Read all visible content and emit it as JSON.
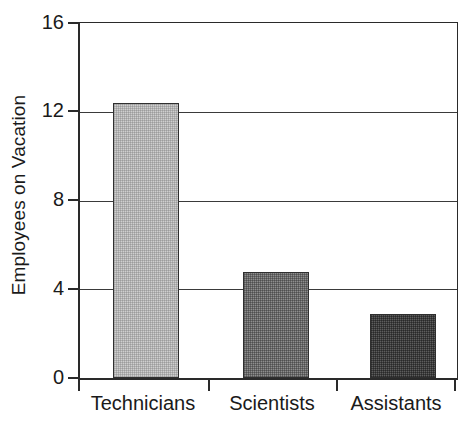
{
  "chart_data": {
    "type": "bar",
    "title": "",
    "xlabel": "",
    "ylabel": "Employees on Vacation",
    "categories": [
      "Technicians",
      "Scientists",
      "Assistants"
    ],
    "values": [
      12.4,
      4.8,
      2.9
    ],
    "ylim": [
      0,
      16
    ],
    "yticks": [
      0,
      4,
      8,
      12,
      16
    ],
    "ytick_labels": [
      "0",
      "4",
      "8",
      "12",
      "16"
    ],
    "grid": true,
    "legend": "none",
    "series": [
      {
        "name": "Employees on Vacation",
        "values": [
          12.4,
          4.8,
          2.9
        ]
      }
    ],
    "bar_styles": [
      {
        "category": "Technicians",
        "fill": "#cfcfcf",
        "shade": "light",
        "outline": "#2f2f2f"
      },
      {
        "category": "Scientists",
        "fill": "#8e8e8e",
        "shade": "medium",
        "outline": "#2f2f2f"
      },
      {
        "category": "Assistants",
        "fill": "#5d5d5d",
        "shade": "dark",
        "outline": "#2f2f2f"
      }
    ]
  },
  "axes": {
    "y_title": "Employees on Vacation",
    "tick_0": "0",
    "tick_4": "4",
    "tick_8": "8",
    "tick_12": "12",
    "tick_16": "16"
  },
  "x_labels": {
    "cat_0": "Technicians",
    "cat_1": "Scientists",
    "cat_2": "Assistants"
  },
  "colors": {
    "axis": "#2a2a2a",
    "grid": "#3a3a3a",
    "text": "#1a1a1a",
    "background": "#ffffff",
    "bar_light": "#cfcfcf",
    "bar_medium": "#8e8e8e",
    "bar_dark": "#5d5d5d"
  }
}
